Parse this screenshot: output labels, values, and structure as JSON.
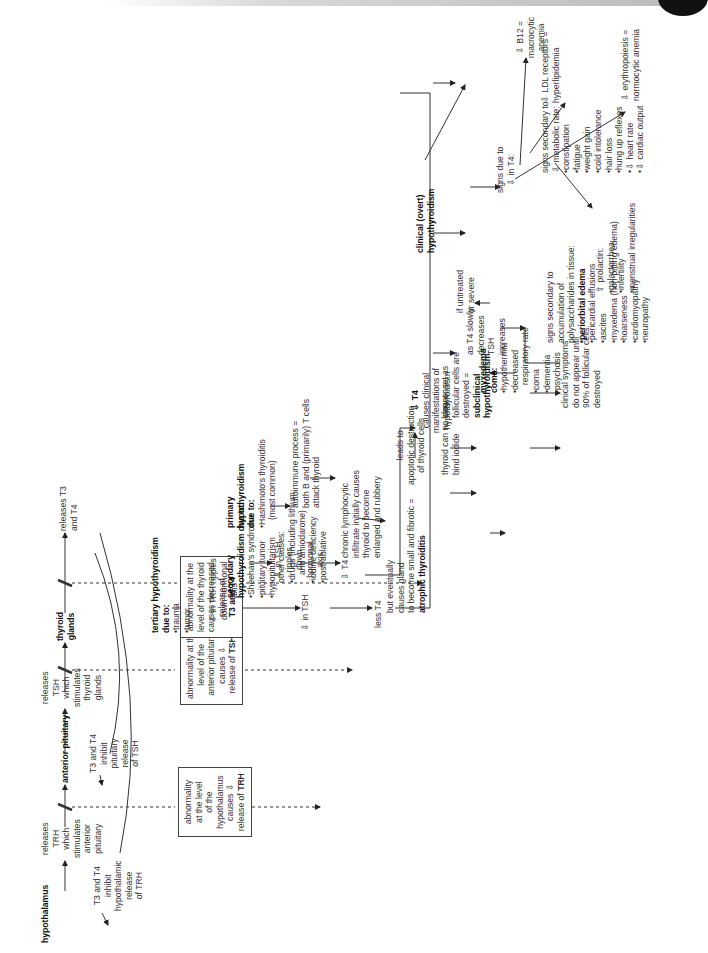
{
  "axis": {
    "hypothalamus": "hypothalamus",
    "releases_trh": [
      "releases",
      "TRH",
      "which",
      "stimulates",
      "anterior",
      "pituitary"
    ],
    "anterior_pituitary": "anterior pituitary",
    "releases_tsh": [
      "releases",
      "TSH",
      "which",
      "stimulates",
      "thyroid",
      "glands"
    ],
    "thyroid_glands": [
      "thyroid",
      "glands"
    ],
    "releases_t3t4": [
      "releases T3",
      "and T4"
    ],
    "feedback_trh": [
      "T3 and T4",
      "inhibit",
      "hypothalamic",
      "release",
      "of TRH"
    ],
    "feedback_tsh": [
      "T3 and T4",
      "inhibit",
      "pituitary",
      "release",
      "of TSH"
    ]
  },
  "boxes": {
    "tertiary_box": [
      "abnormality",
      "at the level",
      "of the",
      "hypothalamus",
      "causes ⇩",
      "release of "
    ],
    "tertiary_box_bold": "TRH",
    "secondary_box": [
      "abnormality at the",
      "level of the",
      "anterior pituitary",
      "causes ⇩",
      "release of "
    ],
    "secondary_box_bold": "TSH",
    "primary_box": [
      "abnormality at the",
      "level of the thyroid",
      "causes decreased",
      "release of"
    ],
    "primary_box_bold": "T3 and T4"
  },
  "tertiary": {
    "title": [
      "tertiary hypothyroidism",
      "due to:"
    ],
    "causes": [
      "trauma",
      "tumor"
    ],
    "ripple": [
      "⇩ in TRH ripples",
      "down hormonal",
      "axis"
    ],
    "tsh": "⇩ in TSH",
    "less_t4": "less T4"
  },
  "secondary": {
    "title": [
      "secondary",
      "hypothyroidism due to:"
    ],
    "causes": [
      "Sheehan's syndrome",
      "pituitary tumor",
      "hypopituitarism"
    ],
    "ripple": [
      "⇩ in TSH",
      "ripples",
      "down",
      "hormonal",
      "axis"
    ],
    "t4": "⇩ T4"
  },
  "primary": {
    "title": [
      "primary",
      "hypothyroidism",
      "due to:"
    ],
    "hashimoto": [
      "Hashimoto's thyroiditis",
      "(most common)"
    ],
    "other_title": "other causes:",
    "other_causes": [
      "drugs (including lithium",
      "and amiodarone)",
      "iodine deficiency",
      "post-ablative"
    ],
    "autoimmune": [
      "autoimmune process =",
      "both B and (primarily) T cells",
      "attack thyroid"
    ],
    "infiltrate": [
      "chronic lymphocytic",
      "infiltrate initially causes",
      "thyroid to become",
      "enlarged and rubbery"
    ],
    "atrophic": [
      "but eventually",
      "causes gland",
      "to become small and fibrotic ="
    ],
    "atrophic_bold": "atrophic thyroiditis",
    "apoptotic": [
      "leads to",
      "apoptotic destruction",
      "of thyroid cells"
    ],
    "iodide": [
      "thyroid can no longer",
      "bind iodide"
    ],
    "subclinical": [
      "slow onset as",
      "follicular cells are",
      "destroyed ="
    ],
    "subclinical_bold": [
      "subclinical",
      "hypothyroidism"
    ],
    "symptoms": [
      "clinical symptoms",
      "do not appear until",
      "90% of follicular cells",
      "destroyed"
    ],
    "tsh_increase": [
      "as T4 slowly",
      "decreases",
      "TSH",
      "increases"
    ]
  },
  "center": {
    "t4_bold": "⇩ T4",
    "t4_text": [
      "causes clinical",
      "manifestations of",
      "hypothyroidism"
    ]
  },
  "clinical": {
    "title": [
      "clinical (overt)",
      "hypothyroidism"
    ],
    "untreated": [
      "if untreated",
      "or severe"
    ],
    "myxedema_title": [
      "myxedema",
      "coma:"
    ],
    "myxedema": [
      "hypothermia",
      "decreased",
      "respiratory rate",
      "coma",
      "dementia",
      "psychosis"
    ],
    "polysacch_title": [
      "signs secondary to",
      "accumulation of",
      "polysaccharides in tissue:"
    ],
    "polysacch_bold": "periorbital edema",
    "polysacch": [
      "pericardial effusions",
      "ascites",
      "myxedema (non-pitting edema)",
      "hoarseness",
      "cardiomyopathy",
      "neuropathy"
    ],
    "metabolic_title": [
      "signs secondary to",
      "⇩ metabolic rate:"
    ],
    "metabolic": [
      "constipation",
      "fatigue",
      "weight gain",
      "cold intolerance",
      "hair loss",
      "hung up reflexes",
      "⇩ heart rate",
      "⇩ cardiac output"
    ],
    "t4_signs": [
      "signs due to",
      "⇩ in T4:"
    ],
    "ldl": [
      "⇩ LDL receptors =",
      "hyperlipidemia"
    ],
    "b12": [
      "⇩ B12 =",
      "macrocytic",
      "anemia"
    ],
    "erythro": [
      "⇩ erythropoiesis =",
      "normocytic anemia"
    ],
    "prolactin_title": "⇧ prolactin:",
    "prolactin": [
      "galactorrhea",
      "infertility",
      "menstrual irregularities"
    ]
  }
}
